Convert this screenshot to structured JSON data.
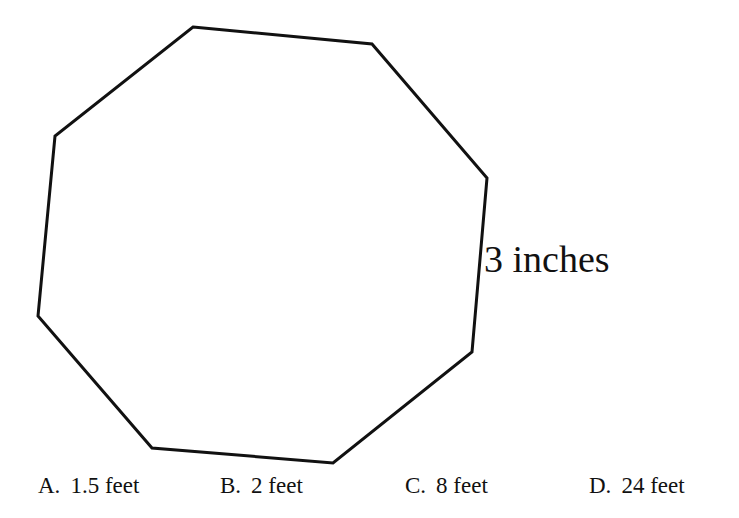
{
  "figure": {
    "shape": "octagon",
    "stroke_color": "#111111",
    "side_label": "3 inches"
  },
  "choices": [
    {
      "letter": "A.",
      "text": "1.5 feet"
    },
    {
      "letter": "B.",
      "text": "2 feet"
    },
    {
      "letter": "C.",
      "text": "8 feet"
    },
    {
      "letter": "D.",
      "text": "24 feet"
    }
  ]
}
